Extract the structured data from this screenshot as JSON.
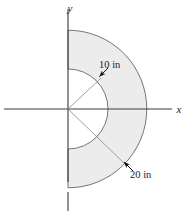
{
  "figure": {
    "axes": {
      "x_label": "x",
      "y_label": "y"
    },
    "dimensions": [
      {
        "id": "inner-radius",
        "label": "10 in",
        "value": 10,
        "unit": "in"
      },
      {
        "id": "outer-radius",
        "label": "20 in",
        "value": 20,
        "unit": "in"
      }
    ],
    "colors": {
      "fill": "#ececec",
      "stroke": "#555555",
      "axis": "#3a3a3a",
      "text": "#1a1a1a"
    },
    "geometry": {
      "shape": "half-annulus",
      "origin_px": [
        68,
        109
      ],
      "inner_radius_px": 40,
      "outer_radius_px": 79,
      "opening_side": "right",
      "start_angle_deg": -90,
      "end_angle_deg": 90
    }
  }
}
